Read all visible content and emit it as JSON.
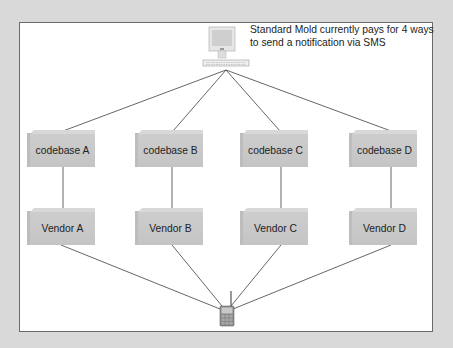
{
  "diagram": {
    "caption": "Standard Mold currently pays for 4 ways to send a notification via SMS",
    "source_node": {
      "label": "computer",
      "icon": "computer-icon"
    },
    "sink_node": {
      "label": "mobile phone",
      "icon": "mobile-phone-icon"
    },
    "codebases": [
      {
        "label": "codebase A"
      },
      {
        "label": "codebase B"
      },
      {
        "label": "codebase C"
      },
      {
        "label": "codebase D"
      }
    ],
    "vendors": [
      {
        "label": "Vendor A"
      },
      {
        "label": "Vendor B"
      },
      {
        "label": "Vendor C"
      },
      {
        "label": "Vendor D"
      }
    ],
    "colors": {
      "frame": "#d9d9d9",
      "panel": "#ffffff",
      "box": "#c9c9c9",
      "line": "#555555"
    }
  }
}
